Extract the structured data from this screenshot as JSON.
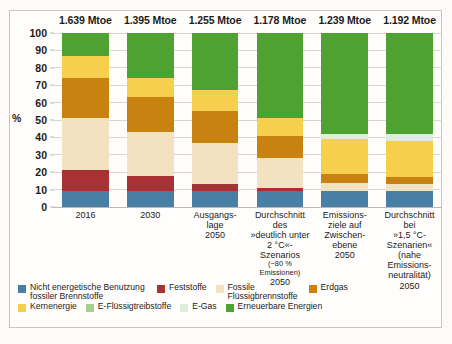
{
  "chart_data": {
    "type": "bar",
    "title": "",
    "xlabel": "",
    "ylabel": "%",
    "ylim": [
      0,
      100
    ],
    "grid": true,
    "stacked": true,
    "legend_position": "bottom",
    "yticks": [
      0,
      10,
      20,
      30,
      40,
      50,
      60,
      70,
      80,
      90,
      100
    ],
    "categories": [
      "2016",
      "2030",
      "Ausgangslage 2050",
      "Durchschnitt des »deutlich unter 2 °C«-Szenarios (−80 % Emissionen) 2050",
      "Emissionsziele auf Zwischenebene 2050",
      "Durchschnitt bei »1,5 °C-Szenarien« (nahe Emissionsneutralität) 2050"
    ],
    "totals": [
      "1.639 Mtoe",
      "1.395 Mtoe",
      "1.255 Mtoe",
      "1.178 Mtoe",
      "1.239 Mtoe",
      "1.192 Mtoe"
    ],
    "series": [
      {
        "name": "Nicht energetische Benutzung fossiler Brennstoffe",
        "color": "#4a7fa5",
        "values": [
          9,
          9,
          9,
          9,
          9,
          9
        ]
      },
      {
        "name": "Feststoffe",
        "color": "#a83232",
        "values": [
          12,
          9,
          4,
          2,
          0,
          0
        ]
      },
      {
        "name": "Fossile Flüssigbrennstoffe",
        "color": "#f2e2bf",
        "values": [
          30,
          25,
          24,
          17,
          5,
          4
        ]
      },
      {
        "name": "Erdgas",
        "color": "#c8820f",
        "values": [
          23,
          20,
          18,
          13,
          5,
          4
        ]
      },
      {
        "name": "Kernenergie",
        "color": "#f6cf4e",
        "values": [
          13,
          11,
          12,
          10,
          20,
          21
        ]
      },
      {
        "name": "E-Flüssigtreibstoffe",
        "color": "#a8d08d",
        "values": [
          0,
          0,
          0,
          0,
          0,
          0
        ]
      },
      {
        "name": "E-Gas",
        "color": "#ddeedd",
        "values": [
          0,
          0,
          0,
          0,
          3,
          4
        ]
      },
      {
        "name": "Erneuerbare Energien",
        "color": "#4da232",
        "values": [
          13,
          26,
          33,
          49,
          58,
          58
        ]
      }
    ]
  },
  "axis": {
    "ylabel": "%"
  },
  "xcats": [
    {
      "l1": "2016",
      "note": "",
      "yr": ""
    },
    {
      "l1": "2030",
      "note": "",
      "yr": ""
    },
    {
      "l1": "Ausgangs-\nlage",
      "note": "",
      "yr": "2050"
    },
    {
      "l1": "Durchschnitt des\n»deutlich unter 2 °C«-\nSzenarios",
      "note": "(−80 % Emissionen)",
      "yr": "2050"
    },
    {
      "l1": "Emissions-\nziele auf\nZwischen-\nebene",
      "note": "",
      "yr": "2050"
    },
    {
      "l1": "Durchschnitt bei\n»1,5 °C-Szenarien«\n(nahe Emissions-\nneutralität)",
      "note": "",
      "yr": "2050"
    }
  ],
  "legend": {
    "row1": [
      {
        "label": "Nicht energetische Benutzung fossiler Brennstoffe",
        "color": "#4a7fa5"
      },
      {
        "label": "Feststoffe",
        "color": "#a83232"
      },
      {
        "label": "Fossile Flüssigbrennstoffe",
        "color": "#f2e2bf"
      },
      {
        "label": "Erdgas",
        "color": "#d2800f"
      }
    ],
    "row2": [
      {
        "label": "Kernenergie",
        "color": "#f6cf4e"
      },
      {
        "label": "E-Flüssigtreibstoffe",
        "color": "#a8d08d"
      },
      {
        "label": "E-Gas",
        "color": "#ddeedd"
      },
      {
        "label": "Erneuerbare Energien",
        "color": "#4da232"
      }
    ]
  }
}
